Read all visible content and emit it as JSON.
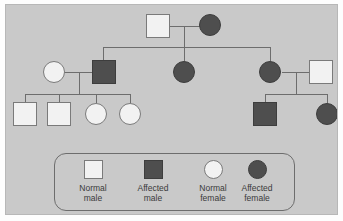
{
  "figure": {
    "type": "pedigree-chart",
    "title": "",
    "background_color": "#c9c9c9",
    "line_color": "#6d6d6d",
    "normal_fill": "#f2f2f2",
    "affected_fill": "#4e4e4e"
  },
  "legend": {
    "items": [
      {
        "id": "normal-male",
        "shape": "square",
        "state": "normal",
        "label": "Normal\nmale",
        "color": "#f2f2f2"
      },
      {
        "id": "affected-male",
        "shape": "square",
        "state": "affected",
        "label": "Affected\nmale",
        "color": "#4e4e4e"
      },
      {
        "id": "normal-female",
        "shape": "circle",
        "state": "normal",
        "label": "Normal\nfemale",
        "color": "#f2f2f2"
      },
      {
        "id": "affected-female",
        "shape": "circle",
        "state": "affected",
        "label": "Affected\nfemale",
        "color": "#4e4e4e"
      }
    ]
  },
  "pedigree": {
    "generations": [
      {
        "generation": 1,
        "individuals": [
          {
            "id": "I-1",
            "shape": "square",
            "state": "normal",
            "sex": "male",
            "label": "Normal male"
          },
          {
            "id": "I-2",
            "shape": "circle",
            "state": "affected",
            "sex": "female",
            "label": "Affected female"
          }
        ]
      },
      {
        "generation": 2,
        "individuals": [
          {
            "id": "II-1",
            "shape": "circle",
            "state": "normal",
            "sex": "female",
            "label": "Normal female"
          },
          {
            "id": "II-2",
            "shape": "square",
            "state": "affected",
            "sex": "male",
            "label": "Affected male"
          },
          {
            "id": "II-3",
            "shape": "circle",
            "state": "affected",
            "sex": "female",
            "label": "Affected female"
          },
          {
            "id": "II-4",
            "shape": "circle",
            "state": "affected",
            "sex": "female",
            "label": "Affected female"
          },
          {
            "id": "II-5",
            "shape": "square",
            "state": "normal",
            "sex": "male",
            "label": "Normal male"
          }
        ]
      },
      {
        "generation": 3,
        "individuals": [
          {
            "id": "III-1",
            "shape": "square",
            "state": "normal",
            "sex": "male",
            "label": "Normal male"
          },
          {
            "id": "III-2",
            "shape": "square",
            "state": "normal",
            "sex": "male",
            "label": "Normal male"
          },
          {
            "id": "III-3",
            "shape": "circle",
            "state": "normal",
            "sex": "female",
            "label": "Normal female"
          },
          {
            "id": "III-4",
            "shape": "circle",
            "state": "normal",
            "sex": "female",
            "label": "Normal female"
          },
          {
            "id": "III-5",
            "shape": "square",
            "state": "affected",
            "sex": "male",
            "label": "Affected male"
          },
          {
            "id": "III-6",
            "shape": "circle",
            "state": "affected",
            "sex": "female",
            "label": "Affected female"
          }
        ]
      }
    ],
    "matings": [
      {
        "id": "mating-1",
        "partners": [
          "I-1",
          "I-2"
        ],
        "children": [
          "II-2",
          "II-3",
          "II-4"
        ]
      },
      {
        "id": "mating-2",
        "partners": [
          "II-1",
          "II-2"
        ],
        "children": [
          "III-1",
          "III-2",
          "III-3",
          "III-4"
        ]
      },
      {
        "id": "mating-3",
        "partners": [
          "II-4",
          "II-5"
        ],
        "children": [
          "III-5",
          "III-6"
        ]
      }
    ]
  }
}
